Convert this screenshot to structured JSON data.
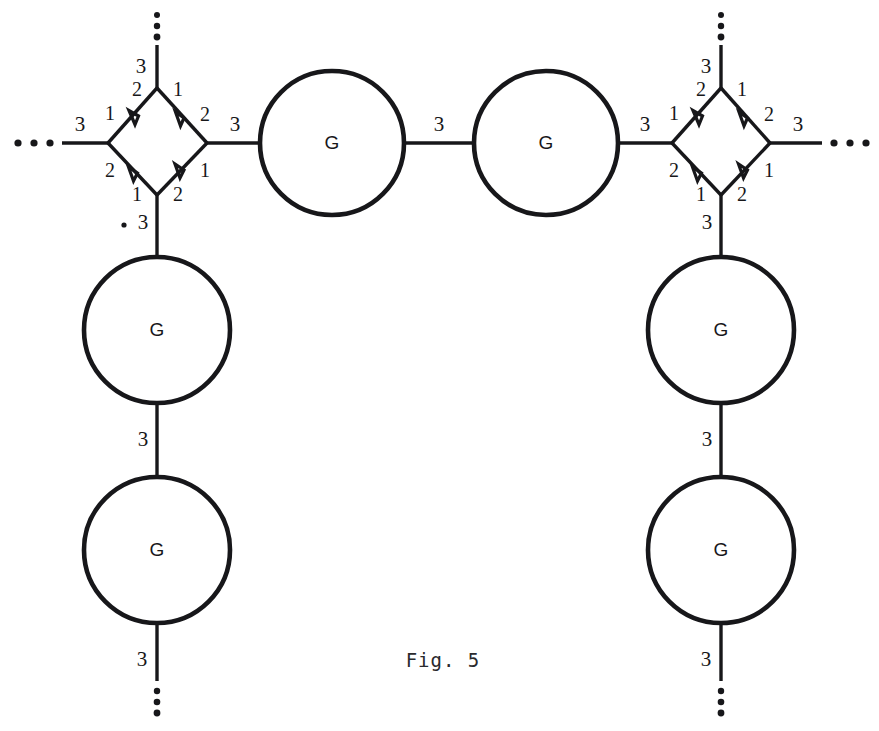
{
  "figure": {
    "caption": "Fig. 5",
    "background_color": "#ffffff",
    "ink_color": "#17171a"
  },
  "node_labels": {
    "circle": "G"
  },
  "edge_labels": {
    "three": "3",
    "one": "1",
    "two": "2"
  },
  "nodes": [
    {
      "id": "diamond-left",
      "kind": "diamond",
      "cx": 157,
      "cy": 142,
      "rx": 50,
      "ry": 54
    },
    {
      "id": "diamond-right",
      "kind": "diamond",
      "cx": 721,
      "cy": 142,
      "rx": 50,
      "ry": 54
    },
    {
      "id": "circle-top-1",
      "kind": "circle",
      "label": "G",
      "cx": 332,
      "cy": 143,
      "r": 72
    },
    {
      "id": "circle-top-2",
      "kind": "circle",
      "label": "G",
      "cx": 546,
      "cy": 143,
      "r": 72
    },
    {
      "id": "circle-left-upper",
      "kind": "circle",
      "label": "G",
      "cx": 157,
      "cy": 330,
      "r": 73
    },
    {
      "id": "circle-left-lower",
      "kind": "circle",
      "label": "G",
      "cx": 157,
      "cy": 550,
      "r": 73
    },
    {
      "id": "circle-right-upper",
      "kind": "circle",
      "label": "G",
      "cx": 721,
      "cy": 330,
      "r": 73
    },
    {
      "id": "circle-right-lower",
      "kind": "circle",
      "label": "G",
      "cx": 721,
      "cy": 550,
      "r": 73
    }
  ],
  "outer_edges": [
    {
      "id": "edge-far-left",
      "label": "3"
    },
    {
      "id": "edge-far-right",
      "label": "3"
    },
    {
      "id": "edge-left-dia-up",
      "label": "3"
    },
    {
      "id": "edge-right-dia-up",
      "label": "3"
    },
    {
      "id": "edge-left-dia-down",
      "label": "3"
    },
    {
      "id": "edge-right-dia-down",
      "label": "3"
    },
    {
      "id": "edge-top-mid-left",
      "label": "3"
    },
    {
      "id": "edge-top-mid-center",
      "label": "3"
    },
    {
      "id": "edge-top-mid-right",
      "label": "3"
    },
    {
      "id": "edge-left-col-mid",
      "label": "3"
    },
    {
      "id": "edge-left-col-tail",
      "label": "3"
    },
    {
      "id": "edge-right-col-mid",
      "label": "3"
    },
    {
      "id": "edge-right-col-tail",
      "label": "3"
    }
  ],
  "diamond_edge_labels": {
    "nw": {
      "near_west": "1",
      "near_north": "2"
    },
    "ne": {
      "near_north": "1",
      "near_east": "2"
    },
    "sw": {
      "near_west": "2",
      "near_south": "1"
    },
    "se": {
      "near_south": "2",
      "near_east": "1"
    }
  },
  "ellipses": [
    {
      "id": "ellipsis-left",
      "orientation": "horizontal",
      "count": 3
    },
    {
      "id": "ellipsis-right",
      "orientation": "horizontal",
      "count": 3
    },
    {
      "id": "ellipsis-top-left",
      "orientation": "vertical",
      "count": 3
    },
    {
      "id": "ellipsis-top-right",
      "orientation": "vertical",
      "count": 3
    },
    {
      "id": "ellipsis-bottom-left",
      "orientation": "vertical",
      "count": 3
    },
    {
      "id": "ellipsis-bottom-right",
      "orientation": "vertical",
      "count": 3
    }
  ]
}
